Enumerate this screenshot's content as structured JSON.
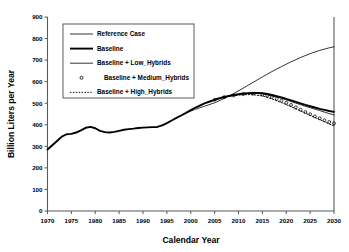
{
  "chart_data": {
    "type": "line",
    "title": "",
    "xlabel": "Calendar Year",
    "ylabel": "Billion Liters per Year",
    "xlim": [
      1970,
      2030
    ],
    "ylim": [
      0,
      900
    ],
    "xticks": [
      1970,
      1975,
      1980,
      1985,
      1990,
      1995,
      2000,
      2005,
      2010,
      2015,
      2020,
      2025,
      2030
    ],
    "yticks": [
      0,
      100,
      200,
      300,
      400,
      500,
      600,
      700,
      800,
      900
    ],
    "grid": false,
    "legend_position": "upper-left-inside",
    "series": [
      {
        "name": "Reference Case",
        "style": "thin-solid",
        "x": [
          1999,
          2001,
          2003,
          2005,
          2007,
          2009,
          2011,
          2013,
          2015,
          2017,
          2019,
          2021,
          2023,
          2025,
          2027,
          2029,
          2030
        ],
        "values": [
          455,
          472,
          487,
          502,
          522,
          545,
          570,
          596,
          622,
          647,
          670,
          692,
          712,
          730,
          745,
          757,
          762
        ]
      },
      {
        "name": "Baseline",
        "style": "thick-solid",
        "x": [
          1970,
          1971,
          1972,
          1973,
          1974,
          1975,
          1976,
          1977,
          1978,
          1979,
          1980,
          1981,
          1982,
          1983,
          1984,
          1985,
          1986,
          1987,
          1988,
          1989,
          1990,
          1991,
          1992,
          1993,
          1994,
          1995,
          1996,
          1997,
          1998,
          1999,
          2000,
          2001,
          2002,
          2003,
          2004,
          2005,
          2006,
          2007,
          2008,
          2009,
          2010,
          2011,
          2012,
          2013,
          2014,
          2015,
          2016,
          2017,
          2018,
          2019,
          2020,
          2021,
          2022,
          2023,
          2024,
          2025,
          2026,
          2027,
          2028,
          2029,
          2030
        ],
        "values": [
          285,
          305,
          325,
          345,
          356,
          358,
          364,
          374,
          386,
          390,
          384,
          372,
          366,
          364,
          367,
          372,
          377,
          380,
          382,
          385,
          387,
          388,
          389,
          390,
          397,
          408,
          420,
          432,
          443,
          455,
          468,
          480,
          490,
          500,
          508,
          516,
          523,
          529,
          534,
          538,
          542,
          545,
          547,
          548,
          548,
          546,
          543,
          538,
          533,
          527,
          520,
          513,
          506,
          499,
          492,
          486,
          480,
          474,
          469,
          464,
          460
        ]
      },
      {
        "name": "Baseline + Low_Hybrids",
        "style": "thin-solid",
        "x": [
          2005,
          2007,
          2009,
          2011,
          2013,
          2015,
          2017,
          2019,
          2021,
          2023,
          2025,
          2027,
          2029,
          2030
        ],
        "values": [
          516,
          529,
          537,
          544,
          546,
          544,
          534,
          523,
          508,
          493,
          479,
          466,
          452,
          446
        ]
      },
      {
        "name": "Baseline + Medium_Hybrids",
        "style": "circle-markers",
        "x": [
          2005,
          2007,
          2009,
          2011,
          2013,
          2015,
          2016,
          2017,
          2018,
          2019,
          2020,
          2021,
          2022,
          2023,
          2024,
          2025,
          2026,
          2027,
          2028,
          2029,
          2030
        ],
        "values": [
          516,
          528,
          536,
          542,
          544,
          540,
          535,
          529,
          521,
          512,
          502,
          492,
          481,
          470,
          459,
          449,
          439,
          430,
          421,
          413,
          407
        ]
      },
      {
        "name": "Baseline + High_Hybrids",
        "style": "dotted",
        "x": [
          2005,
          2007,
          2009,
          2011,
          2013,
          2015,
          2017,
          2019,
          2021,
          2023,
          2025,
          2027,
          2029,
          2030
        ],
        "values": [
          516,
          528,
          535,
          540,
          540,
          534,
          520,
          503,
          484,
          464,
          444,
          424,
          404,
          395
        ]
      }
    ]
  },
  "axes": {
    "y_title": "Billion Liters per Year",
    "x_title": "Calendar Year",
    "y_tick_labels": [
      "900",
      "800",
      "700",
      "600",
      "500",
      "400",
      "300",
      "200",
      "100",
      "0"
    ],
    "x_tick_labels": [
      "1970",
      "1975",
      "1980",
      "1985",
      "1990",
      "1995",
      "2000",
      "2005",
      "2010",
      "2015",
      "2020",
      "2025",
      "2030"
    ]
  },
  "legend": {
    "entries": [
      {
        "label": "Reference Case",
        "marker": "thin-line"
      },
      {
        "label": "Baseline",
        "marker": "thick-line"
      },
      {
        "label": "Baseline + Low_Hybrids",
        "marker": "thin-line"
      },
      {
        "label": "Baseline + Medium_Hybrids",
        "marker": "circle"
      },
      {
        "label": "Baseline + High_Hybrids",
        "marker": "dotted-line"
      }
    ]
  },
  "colors": {
    "line": "#000000",
    "axis": "#555555",
    "background": "#ffffff"
  }
}
